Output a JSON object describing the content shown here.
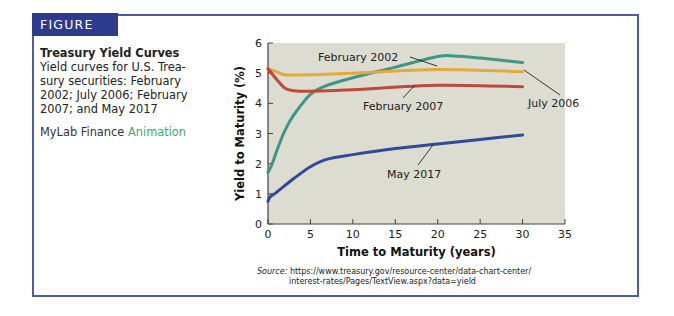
{
  "figure": {
    "tag": "FIGURE 6.3",
    "title": "Treasury Yield Curves",
    "description_lines": [
      "Yield curves for U.S. Trea-",
      "sury securities: February",
      "2002; July 2006; February",
      "2007; and May 2017"
    ],
    "mylab_prefix": "MyLab Finance",
    "mylab_link": "Animation",
    "source_label": "Source:",
    "source_line1": "https://www.treasury.gov/resource-center/data-chart-center/",
    "source_line2": "interest-rates/Pages/TextView.aspx?data=yield"
  },
  "colors": {
    "frame": "#4f5aa8",
    "tag_bg": "#2d3b8e",
    "plot_bg": "#dddcd0",
    "feb2002": "#3d9688",
    "jul2006": "#e5a83a",
    "feb2007": "#c0483a",
    "may2017": "#2f4a9a",
    "animation_link": "#3ba66b"
  },
  "chart_data": {
    "type": "line",
    "title": "Treasury Yield Curves",
    "xlabel": "Time to Maturity (years)",
    "ylabel": "Yield to Maturity (%)",
    "xlim": [
      0,
      35
    ],
    "ylim": [
      0,
      6
    ],
    "xticks": [
      0,
      5,
      10,
      15,
      20,
      25,
      30,
      35
    ],
    "yticks": [
      0,
      1,
      2,
      3,
      4,
      5,
      6
    ],
    "grid": false,
    "legend_position": "inline annotations",
    "series": [
      {
        "name": "February 2002",
        "color": "#3d9688",
        "x": [
          0,
          0.5,
          1,
          2,
          3,
          5,
          7,
          10,
          15,
          20,
          22,
          25,
          30
        ],
        "y": [
          1.7,
          2.0,
          2.4,
          3.1,
          3.6,
          4.3,
          4.6,
          4.85,
          5.2,
          5.55,
          5.57,
          5.5,
          5.35
        ]
      },
      {
        "name": "July 2006",
        "color": "#e5a83a",
        "x": [
          0,
          1,
          2,
          5,
          10,
          20,
          30
        ],
        "y": [
          5.15,
          5.05,
          4.95,
          4.95,
          5.0,
          5.12,
          5.05
        ]
      },
      {
        "name": "February 2007",
        "color": "#c0483a",
        "x": [
          0,
          1,
          2,
          3,
          5,
          10,
          20,
          30
        ],
        "y": [
          5.15,
          4.8,
          4.5,
          4.42,
          4.4,
          4.45,
          4.6,
          4.55
        ]
      },
      {
        "name": "May 2017",
        "color": "#2f4a9a",
        "x": [
          0,
          0.25,
          1,
          3,
          5,
          7,
          10,
          15,
          20,
          25,
          30
        ],
        "y": [
          0.75,
          0.9,
          1.05,
          1.5,
          1.9,
          2.15,
          2.3,
          2.5,
          2.65,
          2.8,
          2.95
        ]
      }
    ],
    "annotations": [
      {
        "text": "February 2002",
        "series": "February 2002"
      },
      {
        "text": "July 2006",
        "series": "July 2006"
      },
      {
        "text": "February 2007",
        "series": "February 2007"
      },
      {
        "text": "May 2017",
        "series": "May 2017"
      }
    ]
  }
}
